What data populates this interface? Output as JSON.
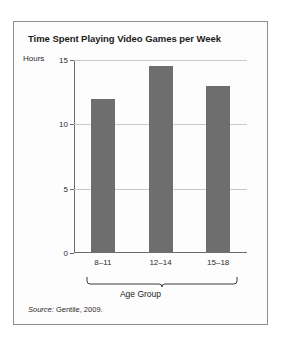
{
  "figure": {
    "title": "Time Spent Playing Video Games per Week",
    "source_lead": "Source:",
    "source_text": " Gentile, 2009."
  },
  "colors": {
    "bar": "#6e6e6e",
    "axis": "#6a6a6a",
    "grid": "#c9c9c9",
    "frame": "#8d8d8d",
    "text": "#1b1b1b",
    "background": "#fdfdfd"
  },
  "chart_data": {
    "type": "bar",
    "title": "Time Spent Playing Video Games per Week",
    "xlabel": "Age Group",
    "ylabel": "Hours",
    "categories": [
      "8–11",
      "12–14",
      "15–18"
    ],
    "values": [
      12,
      14.5,
      13
    ],
    "ylim": [
      0,
      15
    ],
    "yticks": [
      0,
      5,
      10,
      15
    ],
    "ytick_labels": [
      "0",
      "5",
      "10",
      "15"
    ],
    "grid": true,
    "legend": false,
    "annotations": [
      "Source: Gentile, 2009."
    ]
  }
}
